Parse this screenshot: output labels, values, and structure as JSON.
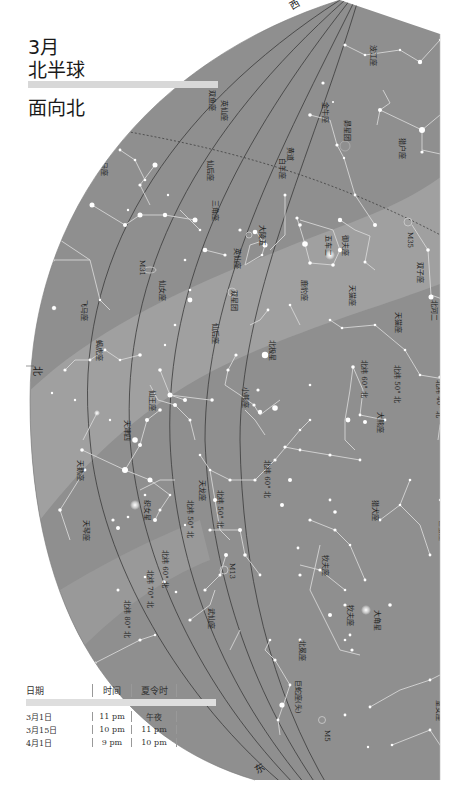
{
  "header": {
    "month": "3月",
    "hemisphere": "北半球",
    "facing": "面向北"
  },
  "cardinals": {
    "north": "北",
    "east": "东",
    "top": "西"
  },
  "colors": {
    "sky": "#8f8f8f",
    "milky_way": "#a6a6a6",
    "grid": "#3a3a3a",
    "constellation_line": "#d6d6d6",
    "star": "#ffffff",
    "paper": "#ffffff"
  },
  "constellations": {
    "perseus_upper": "英仙座",
    "cassiopeia_side": "仙后座",
    "triangulum": "三角座",
    "pisces_n": "双鱼座",
    "andromeda": "仙女座",
    "lacerta": "蝎虎座",
    "cepheus": "仙王座",
    "cygnus": "天鹅座",
    "draco": "天龙座",
    "lyra": "天琴座",
    "hercules": "武仙座",
    "ursa_minor": "小熊座",
    "ursa_major": "大熊座",
    "camelopardalis": "鹿豹座",
    "auriga": "御夫座",
    "perseus": "英仙座",
    "taurus": "金牛座",
    "orion": "猎户座",
    "eridanus": "波江座",
    "gemini": "双子座",
    "lynx": "天猫座",
    "leo_minor": "小狮座",
    "canes_venatici": "猎犬座",
    "bootes": "牧夫座",
    "corona_borealis": "北冕座",
    "serpens": "巨蛇座(头)",
    "virgo": "室女座",
    "cancer": "巨蟹座",
    "pegasus": "飞马座",
    "aries": "白羊座"
  },
  "stars": {
    "capella": "五车二",
    "vega": "织女星",
    "deneb": "天津四",
    "polaris": "北极星",
    "castor": "北河二",
    "pollux": "北河三",
    "algol": "大陵五",
    "pleiades": "昴星团",
    "double_cluster": "双星团",
    "arcturus": "大角星"
  },
  "objects": {
    "m31": "M31",
    "m35": "M35",
    "m13": "M13",
    "m5": "M5"
  },
  "ecliptic_label": "黄道",
  "latitude_lines": {
    "n40": "北纬 40° 北",
    "n50": "北纬 50° 北",
    "n60": "北纬 60° 北",
    "n70": "北纬 70° 北",
    "n80": "北纬 80° 北"
  },
  "dec_labels": {
    "d60": "北纬 60° 北",
    "d50": "北纬 50° 北",
    "d40": "北纬 40° 北"
  },
  "table": {
    "headers": [
      "日期",
      "时间",
      "夏令时"
    ],
    "rows": [
      [
        "3月1日",
        "11 pm",
        "午夜"
      ],
      [
        "3月15日",
        "10 pm",
        "11 pm"
      ],
      [
        "4月1日",
        "9 pm",
        "10 pm"
      ]
    ]
  }
}
